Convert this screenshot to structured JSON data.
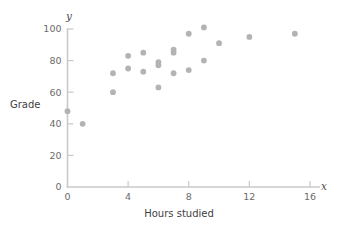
{
  "chart_data": {
    "type": "scatter",
    "title": "",
    "xlabel": "Hours studied",
    "ylabel": "Grade",
    "x_axis_symbol": "x",
    "y_axis_symbol": "y",
    "xlim": [
      0,
      16.8
    ],
    "ylim": [
      0,
      104
    ],
    "xticks": [
      0,
      4,
      8,
      12,
      16
    ],
    "xtick_labels": [
      "0",
      "4",
      "8",
      "12",
      "16"
    ],
    "yticks": [
      0,
      20,
      40,
      60,
      80,
      100
    ],
    "ytick_labels": [
      "0",
      "20",
      "40",
      "60",
      "80",
      "100"
    ],
    "grid": false,
    "legend": null,
    "marker_color": "#b3b3b3",
    "axis_color": "#c9c9c9",
    "points": [
      {
        "x": 0,
        "y": 48
      },
      {
        "x": 1,
        "y": 40
      },
      {
        "x": 3,
        "y": 72
      },
      {
        "x": 3,
        "y": 60
      },
      {
        "x": 4,
        "y": 83
      },
      {
        "x": 4,
        "y": 75
      },
      {
        "x": 5,
        "y": 85
      },
      {
        "x": 5,
        "y": 73
      },
      {
        "x": 6,
        "y": 79
      },
      {
        "x": 6,
        "y": 77
      },
      {
        "x": 6,
        "y": 63
      },
      {
        "x": 7,
        "y": 87
      },
      {
        "x": 7,
        "y": 85
      },
      {
        "x": 7,
        "y": 72
      },
      {
        "x": 8,
        "y": 97
      },
      {
        "x": 8,
        "y": 74
      },
      {
        "x": 9,
        "y": 101
      },
      {
        "x": 9,
        "y": 80
      },
      {
        "x": 10,
        "y": 91
      },
      {
        "x": 12,
        "y": 95
      },
      {
        "x": 15,
        "y": 97
      }
    ]
  }
}
